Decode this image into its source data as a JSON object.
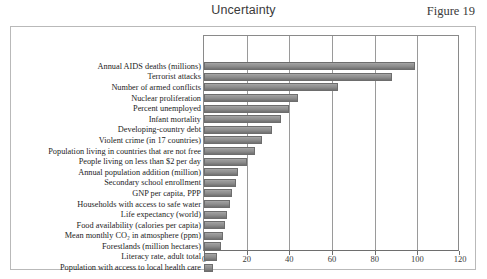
{
  "header": {
    "title": "Uncertainty",
    "figure_number": "Figure 19"
  },
  "chart_data": {
    "type": "bar",
    "orientation": "horizontal",
    "title": "Uncertainty",
    "xlabel": "",
    "ylabel": "",
    "xlim": [
      0,
      120
    ],
    "xticks": [
      0,
      20,
      40,
      60,
      80,
      100,
      120
    ],
    "xtick_labels": [
      "0",
      "20",
      "40",
      "60",
      "80",
      "100",
      "120"
    ],
    "grid": true,
    "legend": false,
    "bar_color": "#8f8f8f",
    "categories": [
      "Annual AIDS deaths (millions)",
      "Terrorist attacks",
      "Number of armed conflicts",
      "Nuclear proliferation",
      "Percent unemployed",
      "Infant mortality",
      "Developing-country debt",
      "Violent crime  (in 17 countries)",
      "Population living in countries that are not free",
      "People living on less than $2 per day",
      "Annual population addition (million)",
      "Secondary school enrollment",
      "GNP per capita, PPP",
      "Households with access to safe water",
      "Life expectancy (world)",
      "Food availability (calories per capita)",
      "Mean monthly CO₂ in atmosphere (ppm)",
      "Forestlands (million hectares)",
      "Literacy rate, adult total",
      "Population with access to local health care"
    ],
    "values": [
      99,
      88,
      63,
      44,
      40,
      36,
      32,
      27,
      24,
      20,
      16,
      15,
      13,
      12,
      11,
      10,
      9,
      8,
      6,
      4
    ]
  }
}
